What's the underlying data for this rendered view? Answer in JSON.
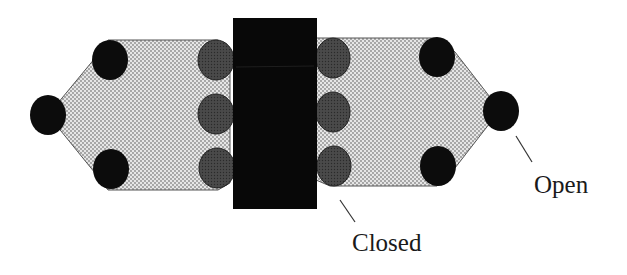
{
  "diagram": {
    "title": "",
    "labels": {
      "open": "Open",
      "closed": "Closed"
    },
    "colors": {
      "background": "#ffffff",
      "block": "#080808",
      "open_circle": "#0c0c0c",
      "closed_circle": "#3a3a3a",
      "stipple_bg": "#e6e6e6",
      "stipple_dot": "#8a8a8a",
      "outline": "#555555"
    },
    "elements": {
      "central_block": "solid black rectangle",
      "left_assembly": "stippled pentagon with 3 open (black) circles and 3 closed (gray) circles",
      "right_assembly": "stippled pentagon with 3 open (black) circles and 3 closed (gray) circles"
    }
  }
}
